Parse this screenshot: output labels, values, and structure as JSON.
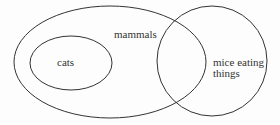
{
  "diagram": {
    "type": "venn",
    "stroke_color": "#333333",
    "sets": [
      {
        "id": "mammals",
        "label": "mammals",
        "shape": "ellipse",
        "cx": 110,
        "cy": 62,
        "rx": 96,
        "ry": 56
      },
      {
        "id": "cats",
        "label": "cats",
        "shape": "ellipse",
        "cx": 71,
        "cy": 63,
        "rx": 41,
        "ry": 27
      },
      {
        "id": "mice_eating_things",
        "label_line1": "mice eating",
        "label_line2": "things",
        "shape": "circle",
        "cx": 212,
        "cy": 61,
        "r": 55
      }
    ],
    "relations": [
      "cats is a subset of mammals",
      "mammals overlaps mice eating things"
    ]
  }
}
